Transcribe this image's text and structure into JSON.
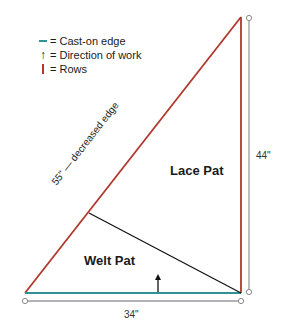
{
  "legend": {
    "items": [
      {
        "symbol": "teal-dash",
        "label": "= Cast-on edge"
      },
      {
        "symbol": "up-arrow",
        "label": "= Direction of work"
      },
      {
        "symbol": "red-bar",
        "label": "= Rows"
      }
    ]
  },
  "labels": {
    "diagonal": "55\" — decreased edge",
    "lace": "Lace Pat",
    "welt": "Welt Pat",
    "height": "44\"",
    "width": "34\""
  },
  "colors": {
    "cast_on": "#2e9393",
    "rows": "#b0382c",
    "welt_line": "#111111",
    "dimension": "#9a9aa2"
  }
}
